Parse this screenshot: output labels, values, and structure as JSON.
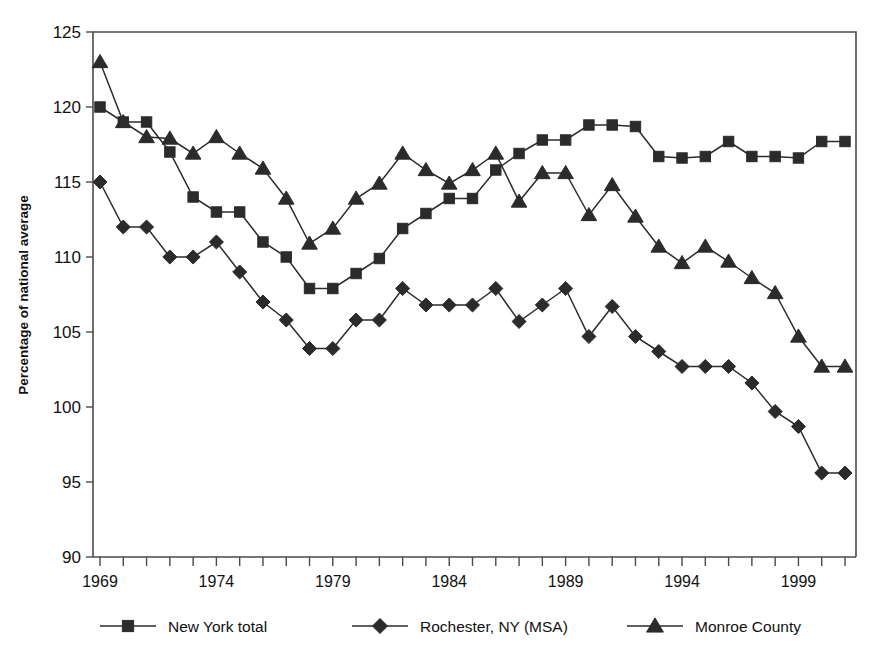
{
  "chart_data": {
    "type": "line",
    "title": "",
    "xlabel": "",
    "ylabel": "Percentage of national average",
    "xlim": [
      1969,
      2001
    ],
    "ylim": [
      90,
      125
    ],
    "yticks": [
      90,
      95,
      100,
      105,
      110,
      115,
      120,
      125
    ],
    "xticks_labeled": [
      1969,
      1974,
      1979,
      1984,
      1989,
      1994,
      1999
    ],
    "xticks_all": [
      1969,
      1970,
      1971,
      1972,
      1973,
      1974,
      1975,
      1976,
      1977,
      1978,
      1979,
      1980,
      1981,
      1982,
      1983,
      1984,
      1985,
      1986,
      1987,
      1988,
      1989,
      1990,
      1991,
      1992,
      1993,
      1994,
      1995,
      1996,
      1997,
      1998,
      1999,
      2000,
      2001
    ],
    "grid": false,
    "legend_position": "bottom",
    "x": [
      1969,
      1970,
      1971,
      1972,
      1973,
      1974,
      1975,
      1976,
      1977,
      1978,
      1979,
      1980,
      1981,
      1982,
      1983,
      1984,
      1985,
      1986,
      1987,
      1988,
      1989,
      1990,
      1991,
      1992,
      1993,
      1994,
      1995,
      1996,
      1997,
      1998,
      1999,
      2000,
      2001
    ],
    "series": [
      {
        "name": "New York total",
        "marker": "square",
        "color": "#2b2b2b",
        "values": [
          120.0,
          119.0,
          119.0,
          117.0,
          114.0,
          113.0,
          113.0,
          111.0,
          110.0,
          107.9,
          107.9,
          108.9,
          109.9,
          111.9,
          112.9,
          113.9,
          113.9,
          115.8,
          116.9,
          117.8,
          117.8,
          118.8,
          118.8,
          118.7,
          116.7,
          116.6,
          116.7,
          117.7,
          116.7,
          116.7,
          116.6,
          117.7,
          117.7
        ]
      },
      {
        "name": "Rochester, NY (MSA)",
        "marker": "diamond",
        "color": "#2b2b2b",
        "values": [
          115.0,
          112.0,
          112.0,
          110.0,
          110.0,
          111.0,
          109.0,
          107.0,
          105.8,
          103.9,
          103.9,
          105.8,
          105.8,
          107.9,
          106.8,
          106.8,
          106.8,
          107.9,
          105.7,
          106.8,
          107.9,
          104.7,
          106.7,
          104.7,
          103.7,
          102.7,
          102.7,
          102.7,
          101.6,
          99.7,
          98.7,
          95.6,
          95.6
        ]
      },
      {
        "name": "Monroe County",
        "marker": "triangle",
        "color": "#2b2b2b",
        "values": [
          123.0,
          119.0,
          118.0,
          117.9,
          116.9,
          118.0,
          116.9,
          115.9,
          113.9,
          110.9,
          111.9,
          113.9,
          114.9,
          116.9,
          115.8,
          114.9,
          115.8,
          116.9,
          113.7,
          115.6,
          115.6,
          112.8,
          114.8,
          112.7,
          110.7,
          109.6,
          110.7,
          109.7,
          108.6,
          107.6,
          104.7,
          102.7,
          102.7
        ]
      }
    ]
  },
  "legend": {
    "items": [
      {
        "label": "New York total",
        "marker": "square"
      },
      {
        "label": "Rochester, NY (MSA)",
        "marker": "diamond"
      },
      {
        "label": "Monroe County",
        "marker": "triangle"
      }
    ]
  }
}
